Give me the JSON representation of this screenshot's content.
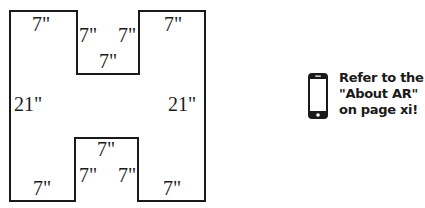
{
  "figure": {
    "shape": "H-shape",
    "stroke_color": "#1a1a1a",
    "labels": {
      "top_left": "7\"",
      "top_notch_left": "7\"",
      "top_notch_right": "7\"",
      "top_notch_bottom": "7\"",
      "top_right": "7\"",
      "left_side": "21\"",
      "right_side": "21\"",
      "bottom_notch_top": "7\"",
      "bottom_notch_left": "7\"",
      "bottom_notch_right": "7\"",
      "bottom_left": "7\"",
      "bottom_right": "7\""
    }
  },
  "ar_note": {
    "icon": "smartphone-icon",
    "lines": [
      "Refer to the",
      "\"About AR\"",
      "on page xi!"
    ]
  }
}
